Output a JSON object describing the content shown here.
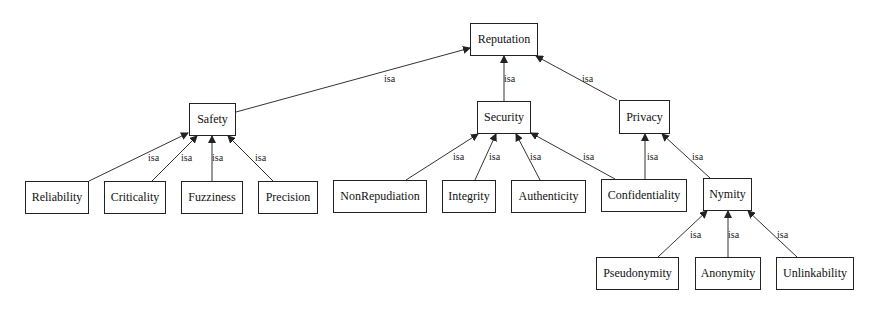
{
  "diagram": {
    "type": "taxonomy-isa-hierarchy",
    "edge_label": "isa",
    "nodes": {
      "reputation": "Reputation",
      "safety": "Safety",
      "security": "Security",
      "privacy": "Privacy",
      "reliability": "Reliability",
      "criticality": "Criticality",
      "fuzziness": "Fuzziness",
      "precision": "Precision",
      "nonrepudiation": "NonRepudiation",
      "integrity": "Integrity",
      "authenticity": "Authenticity",
      "confidentiality": "Confidentiality",
      "nymity": "Nymity",
      "pseudonymity": "Pseudonymity",
      "anonymity": "Anonymity",
      "unlinkability": "Unlinkability"
    },
    "edges": [
      {
        "from": "Safety",
        "to": "Reputation",
        "label": "isa"
      },
      {
        "from": "Security",
        "to": "Reputation",
        "label": "isa"
      },
      {
        "from": "Privacy",
        "to": "Reputation",
        "label": "isa"
      },
      {
        "from": "Reliability",
        "to": "Safety",
        "label": "isa"
      },
      {
        "from": "Criticality",
        "to": "Safety",
        "label": "isa"
      },
      {
        "from": "Fuzziness",
        "to": "Safety",
        "label": "isa"
      },
      {
        "from": "Precision",
        "to": "Safety",
        "label": "isa"
      },
      {
        "from": "NonRepudiation",
        "to": "Security",
        "label": "isa"
      },
      {
        "from": "Integrity",
        "to": "Security",
        "label": "isa"
      },
      {
        "from": "Authenticity",
        "to": "Security",
        "label": "isa"
      },
      {
        "from": "Confidentiality",
        "to": "Security",
        "label": "isa"
      },
      {
        "from": "Confidentiality",
        "to": "Privacy",
        "label": "isa"
      },
      {
        "from": "Nymity",
        "to": "Privacy",
        "label": "isa"
      },
      {
        "from": "Pseudonymity",
        "to": "Nymity",
        "label": "isa"
      },
      {
        "from": "Anonymity",
        "to": "Nymity",
        "label": "isa"
      },
      {
        "from": "Unlinkability",
        "to": "Nymity",
        "label": "isa"
      }
    ]
  }
}
